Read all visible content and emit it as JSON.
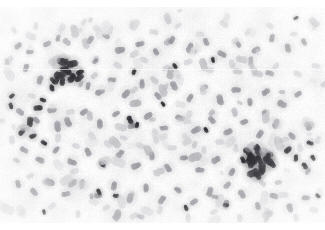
{
  "image": {
    "kind": "microscopy-smear",
    "description": "Hematology smear micrograph: dense field of small round leukocyte nuclei on a pale background, with two focal clusters of darkly stained cells.",
    "width": 325,
    "height": 230,
    "stain": "grayscale / desaturated Wright-Giemsa",
    "background_color": "#fbfbfb",
    "margin_color": "#ffffff",
    "top_margin_px": 7,
    "bottom_margin_px": 7,
    "scan_seam_y": 69,
    "vignette": true,
    "palette": {
      "background": "#fbfbfb",
      "cell_lightest": "#e2e2e4",
      "cell_light": "#d2d2d6",
      "cell_mid": "#b5b5bb",
      "cell_dark": "#8d8d95",
      "cell_darker": "#5e5e66",
      "cell_darkest": "#2b2b31"
    },
    "clusters": [
      {
        "name": "upper-left-dark-cluster",
        "cx": 66,
        "cy": 70,
        "rx": 20,
        "ry": 17
      },
      {
        "name": "lower-right-dark-cluster",
        "cx": 259,
        "cy": 160,
        "rx": 24,
        "ry": 19
      }
    ],
    "cell_count_approx": 430,
    "cell_radius_range": [
      2.4,
      7.2
    ],
    "chart_data": {
      "type": "scatter",
      "title": "Cell nuclei positions (px)",
      "xlabel": "x (px)",
      "ylabel": "y (px)",
      "xlim": [
        0,
        325
      ],
      "ylim": [
        0,
        230
      ],
      "grid": false,
      "legend": null,
      "series": [
        {
          "name": "dark-stained-nuclei",
          "color": "#2b2b31",
          "points": [
            [
              62,
              62,
              5.2
            ],
            [
              72,
              64,
              5.6
            ],
            [
              60,
              75,
              5.8
            ],
            [
              72,
              78,
              5.2
            ],
            [
              80,
              72,
              4.0
            ],
            [
              52,
              88,
              3.6
            ],
            [
              43,
              100,
              3.2
            ],
            [
              38,
              108,
              4.4
            ],
            [
              30,
              122,
              4.8
            ],
            [
              22,
              132,
              4.2
            ],
            [
              33,
              136,
              3.6
            ],
            [
              44,
              143,
              3.4
            ],
            [
              130,
              120,
              4.2
            ],
            [
              137,
              125,
              3.0
            ],
            [
              102,
              164,
              3.4
            ],
            [
              134,
              72,
              3.2
            ],
            [
              213,
              60,
              3.0
            ],
            [
              175,
              66,
              3.2
            ],
            [
              248,
              152,
              5.0
            ],
            [
              258,
              150,
              5.6
            ],
            [
              268,
              156,
              5.0
            ],
            [
              252,
              163,
              5.4
            ],
            [
              262,
              168,
              5.8
            ],
            [
              272,
              164,
              4.4
            ],
            [
              258,
              176,
              4.0
            ],
            [
              243,
              160,
              3.6
            ],
            [
              288,
              150,
              4.2
            ],
            [
              296,
              158,
              3.4
            ],
            [
              305,
              166,
              3.8
            ],
            [
              313,
              158,
              3.0
            ],
            [
              310,
              143,
              3.4
            ],
            [
              318,
              196,
              2.8
            ],
            [
              116,
              196,
              3.2
            ],
            [
              99,
              192,
              3.4
            ],
            [
              186,
              208,
              3.2
            ],
            [
              226,
              205,
              3.0
            ],
            [
              44,
              212,
              2.6
            ],
            [
              12,
              96,
              3.0
            ],
            [
              11,
              106,
              3.4
            ],
            [
              296,
              18,
              2.6
            ],
            [
              163,
              104,
              2.8
            ],
            [
              206,
              130,
              3.0
            ]
          ]
        },
        {
          "name": "mid-gray-nuclei",
          "color": "#8d8d95",
          "points": [
            [
              18,
              46,
              4.0
            ],
            [
              30,
              52,
              3.6
            ],
            [
              47,
              44,
              4.2
            ],
            [
              58,
              38,
              3.4
            ],
            [
              90,
              40,
              4.6
            ],
            [
              106,
              36,
              4.0
            ],
            [
              120,
              50,
              5.0
            ],
            [
              140,
              44,
              4.4
            ],
            [
              156,
              52,
              3.8
            ],
            [
              172,
              40,
              4.2
            ],
            [
              190,
              48,
              5.2
            ],
            [
              206,
              42,
              4.0
            ],
            [
              222,
              54,
              4.6
            ],
            [
              238,
              44,
              3.8
            ],
            [
              256,
              50,
              4.4
            ],
            [
              272,
              38,
              4.0
            ],
            [
              288,
              48,
              4.6
            ],
            [
              304,
              42,
              3.6
            ],
            [
              26,
              68,
              4.2
            ],
            [
              40,
              80,
              4.6
            ],
            [
              88,
              86,
              4.0
            ],
            [
              100,
              92,
              4.8
            ],
            [
              112,
              80,
              4.2
            ],
            [
              126,
              94,
              5.0
            ],
            [
              142,
              84,
              4.4
            ],
            [
              158,
              96,
              4.0
            ],
            [
              174,
              86,
              4.8
            ],
            [
              190,
              98,
              4.4
            ],
            [
              204,
              88,
              4.0
            ],
            [
              220,
              100,
              5.2
            ],
            [
              236,
              90,
              4.6
            ],
            [
              250,
              102,
              4.0
            ],
            [
              266,
              92,
              4.4
            ],
            [
              282,
              104,
              4.8
            ],
            [
              298,
              94,
              4.0
            ],
            [
              20,
              112,
              4.4
            ],
            [
              36,
              120,
              4.0
            ],
            [
              52,
              110,
              4.6
            ],
            [
              68,
              122,
              5.0
            ],
            [
              84,
              112,
              4.2
            ],
            [
              100,
              124,
              4.6
            ],
            [
              116,
              114,
              4.0
            ],
            [
              132,
              126,
              4.4
            ],
            [
              148,
              116,
              4.8
            ],
            [
              164,
              128,
              4.2
            ],
            [
              180,
              118,
              4.6
            ],
            [
              196,
              130,
              5.0
            ],
            [
              212,
              120,
              4.2
            ],
            [
              228,
              132,
              4.6
            ],
            [
              244,
              122,
              4.0
            ],
            [
              260,
              134,
              4.4
            ],
            [
              276,
              124,
              4.8
            ],
            [
              292,
              136,
              4.2
            ],
            [
              308,
              126,
              4.6
            ],
            [
              24,
              150,
              4.2
            ],
            [
              40,
              160,
              4.6
            ],
            [
              56,
              150,
              4.0
            ],
            [
              72,
              162,
              4.8
            ],
            [
              88,
              152,
              4.4
            ],
            [
              104,
              164,
              4.0
            ],
            [
              120,
              154,
              4.6
            ],
            [
              136,
              166,
              5.0
            ],
            [
              152,
              156,
              4.2
            ],
            [
              168,
              168,
              4.6
            ],
            [
              184,
              158,
              4.0
            ],
            [
              200,
              170,
              4.4
            ],
            [
              216,
              160,
              4.8
            ],
            [
              232,
              172,
              4.2
            ],
            [
              18,
              184,
              4.0
            ],
            [
              34,
              192,
              4.4
            ],
            [
              50,
              182,
              4.8
            ],
            [
              66,
              194,
              4.2
            ],
            [
              82,
              184,
              4.6
            ],
            [
              98,
              196,
              4.0
            ],
            [
              114,
              186,
              4.4
            ],
            [
              130,
              198,
              4.8
            ],
            [
              146,
              188,
              4.2
            ],
            [
              162,
              200,
              4.6
            ],
            [
              178,
              190,
              4.0
            ],
            [
              194,
              202,
              4.4
            ],
            [
              210,
              192,
              4.8
            ],
            [
              226,
              204,
              4.2
            ],
            [
              242,
              194,
              4.6
            ],
            [
              258,
              206,
              4.0
            ],
            [
              274,
              196,
              4.4
            ],
            [
              290,
              208,
              4.8
            ],
            [
              306,
              198,
              4.2
            ]
          ]
        },
        {
          "name": "light-gray-nuclei",
          "color": "#cfcfd4",
          "points": [
            [
              14,
              30,
              3.6
            ],
            [
              36,
              26,
              4.0
            ],
            [
              62,
              28,
              4.6
            ],
            [
              84,
              22,
              3.8
            ],
            [
              110,
              30,
              4.4
            ],
            [
              132,
              24,
              4.0
            ],
            [
              154,
              32,
              4.6
            ],
            [
              178,
              26,
              3.8
            ],
            [
              200,
              34,
              4.2
            ],
            [
              224,
              24,
              4.6
            ],
            [
              248,
              32,
              4.0
            ],
            [
              270,
              26,
              4.4
            ],
            [
              294,
              34,
              3.8
            ],
            [
              314,
              26,
              4.2
            ],
            [
              10,
              60,
              4.4
            ],
            [
              32,
              96,
              4.0
            ],
            [
              54,
              64,
              4.6
            ],
            [
              96,
              60,
              4.2
            ],
            [
              118,
              66,
              4.8
            ],
            [
              144,
              60,
              4.4
            ],
            [
              166,
              68,
              4.0
            ],
            [
              188,
              62,
              4.6
            ],
            [
              210,
              70,
              4.2
            ],
            [
              232,
              64,
              4.8
            ],
            [
              254,
              72,
              4.4
            ],
            [
              276,
              66,
              4.0
            ],
            [
              298,
              74,
              4.6
            ],
            [
              316,
              66,
              4.2
            ],
            [
              12,
              140,
              4.4
            ],
            [
              30,
              176,
              4.0
            ],
            [
              58,
              138,
              4.6
            ],
            [
              76,
              146,
              4.2
            ],
            [
              92,
              136,
              4.8
            ],
            [
              108,
              144,
              4.4
            ],
            [
              124,
              138,
              4.0
            ],
            [
              140,
              146,
              4.6
            ],
            [
              156,
              140,
              4.2
            ],
            [
              172,
              148,
              4.8
            ],
            [
              188,
              142,
              4.4
            ],
            [
              204,
              150,
              4.0
            ],
            [
              220,
              142,
              4.6
            ],
            [
              236,
              148,
              4.2
            ],
            [
              284,
              140,
              4.8
            ],
            [
              300,
              148,
              4.4
            ],
            [
              318,
              140,
              4.0
            ],
            [
              22,
              212,
              4.0
            ],
            [
              52,
              206,
              4.4
            ],
            [
              78,
              214,
              3.8
            ],
            [
              106,
              208,
              4.2
            ],
            [
              134,
              216,
              4.6
            ],
            [
              160,
              210,
              4.0
            ],
            [
              188,
              218,
              4.4
            ],
            [
              214,
              212,
              3.8
            ],
            [
              240,
              218,
              4.2
            ],
            [
              268,
              212,
              4.6
            ],
            [
              296,
              218,
              4.0
            ],
            [
              314,
              210,
              4.4
            ]
          ]
        }
      ]
    }
  },
  "accessibility": {
    "alt_text": "Grayscale microscopy image of a blood or bone marrow smear showing numerous round cell nuclei with two clusters of darkly stained cells."
  }
}
